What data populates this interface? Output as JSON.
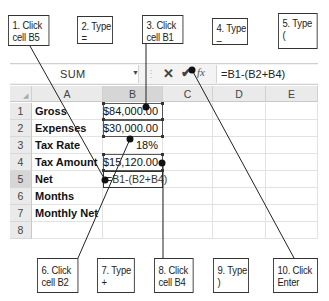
{
  "callouts_top": [
    {
      "line1": "1. Click",
      "line2": "cell B5"
    },
    {
      "line1": "2. Type",
      "line2": "="
    },
    {
      "line1": "3. Click",
      "line2": "cell B1"
    },
    {
      "line1": "4. Type",
      "line2": "–"
    },
    {
      "line1": "5. Type",
      "line2": "("
    }
  ],
  "callouts_bottom": [
    {
      "line1": "6. Click",
      "line2": "cell B2"
    },
    {
      "line1": "7. Type",
      "line2": "+"
    },
    {
      "line1": "8. Click",
      "line2": "cell B4"
    },
    {
      "line1": "9. Type",
      "line2": ")"
    },
    {
      "line1": "10. Click",
      "line2": "Enter"
    }
  ],
  "formula_bar": {
    "name_box": "SUM",
    "dropdown_icon": "▼",
    "cancel_icon": "✕",
    "enter_icon": "✔",
    "fx_label": "fx",
    "formula": "=B1-(B2+B4)"
  },
  "columns": [
    "A",
    "B",
    "C",
    "D",
    "E"
  ],
  "rows": [
    {
      "num": "1",
      "a": "Gross",
      "b": "$84,000.00"
    },
    {
      "num": "2",
      "a": "Expenses",
      "b": "$30,000.00"
    },
    {
      "num": "3",
      "a": "Tax Rate",
      "b": "18%"
    },
    {
      "num": "4",
      "a": "Tax Amount",
      "b": "$15,120.00"
    },
    {
      "num": "5",
      "a": "Net",
      "b": "=B1-(B2+B4)"
    },
    {
      "num": "6",
      "a": "Months",
      "b": ""
    },
    {
      "num": "7",
      "a": "Monthly Net",
      "b": ""
    },
    {
      "num": "8",
      "a": "",
      "b": ""
    }
  ]
}
